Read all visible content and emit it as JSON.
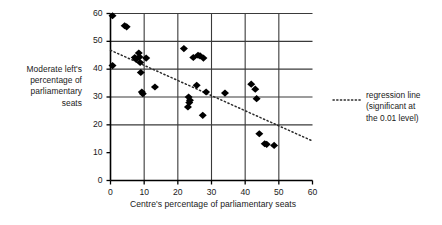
{
  "chart_data": {
    "type": "scatter",
    "title": "",
    "xlabel": "Centre's percentage of parliamentary seats",
    "ylabel": "Moderate left's percentage of parliamentary seats",
    "xlim": [
      0,
      60
    ],
    "ylim": [
      0,
      60
    ],
    "xticks": [
      0,
      10,
      20,
      30,
      40,
      50,
      60
    ],
    "yticks": [
      0,
      10,
      20,
      30,
      40,
      50,
      60
    ],
    "xtick_labels": [
      "0",
      "10",
      "20",
      "30",
      "40",
      "50",
      "60"
    ],
    "ytick_labels": [
      "0",
      "10",
      "20",
      "30",
      "40",
      "50",
      "60"
    ],
    "grid": true,
    "grid_x_values": [
      10,
      20,
      30,
      40,
      50
    ],
    "grid_y_values": [
      20,
      30,
      40,
      50,
      60
    ],
    "legend_position": "right",
    "marker": "diamond",
    "marker_color": "#000000",
    "series": [
      {
        "name": "countries",
        "points": [
          [
            0.6,
            59.2
          ],
          [
            0.6,
            41.3
          ],
          [
            4.2,
            55.6
          ],
          [
            4.8,
            55.2
          ],
          [
            7.2,
            44.2
          ],
          [
            7.6,
            43.6
          ],
          [
            8.4,
            45.8
          ],
          [
            8.6,
            44.4
          ],
          [
            8.8,
            42.4
          ],
          [
            9.0,
            38.8
          ],
          [
            9.3,
            31.8
          ],
          [
            9.6,
            31.2
          ],
          [
            10.6,
            44.0
          ],
          [
            13.2,
            33.6
          ],
          [
            21.8,
            47.4
          ],
          [
            23.2,
            30.0
          ],
          [
            23.0,
            26.4
          ],
          [
            23.4,
            28.0
          ],
          [
            23.6,
            28.8
          ],
          [
            24.6,
            44.2
          ],
          [
            25.6,
            34.2
          ],
          [
            26.0,
            45.0
          ],
          [
            26.6,
            44.8
          ],
          [
            27.4,
            23.4
          ],
          [
            27.6,
            44.0
          ],
          [
            28.4,
            31.8
          ],
          [
            34.0,
            31.4
          ],
          [
            41.8,
            34.6
          ],
          [
            43.0,
            32.8
          ],
          [
            43.4,
            29.4
          ],
          [
            44.2,
            16.8
          ],
          [
            45.8,
            13.2
          ],
          [
            46.4,
            13.0
          ],
          [
            48.6,
            12.6
          ]
        ]
      }
    ],
    "regression_line": {
      "label_line1": "regression line",
      "label_line2": "(significant at",
      "label_line3": "the 0.01 level)",
      "style": "dotted",
      "color": "#2b2b2b",
      "x_start": 0,
      "y_start": 46.8,
      "x_end": 60,
      "y_end": 14.2
    }
  },
  "axis": {
    "ylabel_line1": "Moderate left's",
    "ylabel_line2": "percentage of",
    "ylabel_line3": "parliamentary",
    "ylabel_line4": "seats",
    "xlabel": "Centre's percentage of parliamentary seats"
  },
  "colors": {
    "axis": "#000000",
    "grid": "#3a3a3a",
    "marker": "#000000",
    "text": "#1a1a1a",
    "background": "#ffffff"
  }
}
